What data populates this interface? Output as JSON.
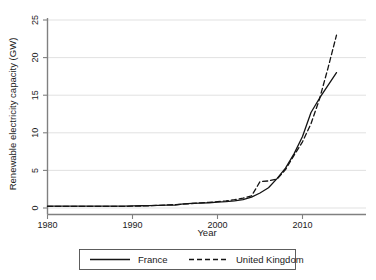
{
  "chart_data": {
    "type": "line",
    "title": "",
    "xlabel": "Year",
    "ylabel": "Renewable electricity capacity (GW)",
    "xlim": [
      1980,
      2015
    ],
    "ylim": [
      0,
      25
    ],
    "xticks": [
      1980,
      1990,
      2000,
      2010
    ],
    "yticks": [
      0,
      5,
      10,
      15,
      20,
      25
    ],
    "grid": "horizontal",
    "legend_position": "below-plot",
    "x": [
      1980,
      1981,
      1982,
      1983,
      1984,
      1985,
      1986,
      1987,
      1988,
      1989,
      1990,
      1991,
      1992,
      1993,
      1994,
      1995,
      1996,
      1997,
      1998,
      1999,
      2000,
      2001,
      2002,
      2003,
      2004,
      2005,
      2006,
      2007,
      2008,
      2009,
      2010,
      2011,
      2012,
      2013,
      2014
    ],
    "series": [
      {
        "name": "France",
        "style": "solid",
        "color": "#141414",
        "values": [
          0.25,
          0.25,
          0.25,
          0.25,
          0.25,
          0.25,
          0.25,
          0.25,
          0.25,
          0.25,
          0.28,
          0.3,
          0.32,
          0.35,
          0.38,
          0.4,
          0.55,
          0.62,
          0.65,
          0.7,
          0.78,
          0.85,
          0.95,
          1.1,
          1.45,
          2.0,
          2.7,
          3.9,
          5.3,
          7.2,
          9.5,
          12.7,
          14.6,
          16.3,
          18.0
        ]
      },
      {
        "name": "United Kingdom",
        "style": "dashed",
        "color": "#141414",
        "values": [
          0.22,
          0.22,
          0.22,
          0.22,
          0.22,
          0.22,
          0.22,
          0.22,
          0.22,
          0.22,
          0.24,
          0.26,
          0.3,
          0.35,
          0.4,
          0.45,
          0.52,
          0.6,
          0.68,
          0.75,
          0.85,
          0.95,
          1.1,
          1.3,
          1.6,
          3.5,
          3.6,
          3.85,
          5.1,
          7.0,
          8.8,
          11.2,
          14.5,
          18.6,
          23.0
        ]
      }
    ],
    "legend": [
      {
        "label": "France",
        "style": "solid"
      },
      {
        "label": "United Kingdom",
        "style": "dashed"
      }
    ]
  },
  "axis": {
    "y_title": "Renewable electricity capacity (GW)",
    "x_title": "Year",
    "y_tick_labels": [
      "0",
      "5",
      "10",
      "15",
      "20",
      "25"
    ],
    "x_tick_labels": [
      "1980",
      "1990",
      "2000",
      "2010"
    ]
  },
  "legend": {
    "france_label": "France",
    "uk_label": "United Kingdom"
  },
  "colors": {
    "line": "#141414",
    "grid": "#d9d9d9",
    "axis": "#808080",
    "background": "#ffffff"
  }
}
